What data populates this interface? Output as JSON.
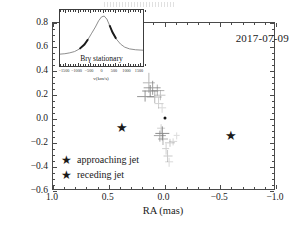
{
  "figure": {
    "date_label": "2017-07-09"
  },
  "axes": {
    "xlabel": "RA (mas)",
    "ylabel": "DEC (mas)",
    "xticks": [
      "1.0",
      "0.5",
      "0.0",
      "-0.5",
      "-1.0"
    ],
    "xtick_values": [
      1.0,
      0.5,
      0.0,
      -0.5,
      -1.0
    ],
    "yticks": [
      "0.8",
      "0.6",
      "0.4",
      "0.2",
      "0.0",
      "-0.2",
      "-0.4",
      "-0.6"
    ],
    "ytick_values": [
      0.8,
      0.6,
      0.4,
      0.2,
      0.0,
      -0.2,
      -0.4,
      -0.6
    ],
    "xlim": [
      1.0,
      -1.0
    ],
    "ylim": [
      -0.6,
      0.8
    ]
  },
  "legend": {
    "items": [
      {
        "marker": "star",
        "label": "approaching jet"
      },
      {
        "marker": "star",
        "label": "receding jet"
      }
    ]
  },
  "inset": {
    "label": "Brγ stationary",
    "xlabel": "v(km/s)",
    "xticks": [
      "-1500",
      "-1000",
      "-500",
      "0",
      "500",
      "1000",
      "1500"
    ],
    "xtick_values": [
      -1500,
      -1000,
      -500,
      0,
      500,
      1000,
      1500
    ]
  },
  "chart_data": {
    "type": "scatter",
    "title": "",
    "xlabel": "RA (mas)",
    "ylabel": "DEC (mas)",
    "xlim": [
      1.0,
      -1.0
    ],
    "ylim": [
      -0.6,
      0.8
    ],
    "grid": false,
    "legend_position": "lower-left",
    "annotations": [
      {
        "text": "2017-07-09",
        "x": -0.62,
        "y": 0.63
      }
    ],
    "series": [
      {
        "name": "approaching jet",
        "marker": "star",
        "color": "#1a1a1a",
        "points": [
          {
            "x": 0.38,
            "y": -0.07
          }
        ]
      },
      {
        "name": "receding jet",
        "marker": "star",
        "color": "#1a1a1a",
        "points": [
          {
            "x": -0.6,
            "y": -0.13
          }
        ]
      },
      {
        "name": "continuum centroid",
        "marker": "dot",
        "color": "#111111",
        "points": [
          {
            "x": 0.0,
            "y": 0.01
          }
        ]
      },
      {
        "name": "photocentre offsets",
        "marker": "cross-errorbar",
        "color": "#7d7d7d",
        "points": [
          {
            "x": 0.14,
            "y": 0.3,
            "xerr": 0.055,
            "yerr": 0.085,
            "alpha": 0.55
          },
          {
            "x": 0.11,
            "y": 0.26,
            "xerr": 0.075,
            "yerr": 0.06,
            "alpha": 0.75
          },
          {
            "x": 0.13,
            "y": 0.23,
            "xerr": 0.07,
            "yerr": 0.05,
            "alpha": 0.85
          },
          {
            "x": 0.06,
            "y": 0.24,
            "xerr": 0.06,
            "yerr": 0.045,
            "alpha": 0.6
          },
          {
            "x": 0.17,
            "y": 0.19,
            "xerr": 0.08,
            "yerr": 0.045,
            "alpha": 0.8
          },
          {
            "x": 0.09,
            "y": 0.18,
            "xerr": 0.065,
            "yerr": 0.05,
            "alpha": 0.55
          },
          {
            "x": 0.04,
            "y": 0.2,
            "xerr": 0.05,
            "yerr": 0.04,
            "alpha": 0.45
          },
          {
            "x": 0.05,
            "y": 0.13,
            "xerr": 0.04,
            "yerr": 0.045,
            "alpha": 0.35
          },
          {
            "x": 0.02,
            "y": 0.09,
            "xerr": 0.035,
            "yerr": 0.035,
            "alpha": 0.28
          },
          {
            "x": 0.03,
            "y": -0.08,
            "xerr": 0.035,
            "yerr": 0.04,
            "alpha": 0.35
          },
          {
            "x": 0.02,
            "y": -0.12,
            "xerr": 0.06,
            "yerr": 0.055,
            "alpha": 0.85
          },
          {
            "x": 0.04,
            "y": -0.14,
            "xerr": 0.055,
            "yerr": 0.045,
            "alpha": 0.7
          },
          {
            "x": 0.01,
            "y": -0.17,
            "xerr": 0.045,
            "yerr": 0.05,
            "alpha": 0.6
          },
          {
            "x": -0.05,
            "y": -0.2,
            "xerr": 0.045,
            "yerr": 0.035,
            "alpha": 0.4
          },
          {
            "x": -0.08,
            "y": -0.19,
            "xerr": 0.035,
            "yerr": 0.03,
            "alpha": 0.3
          },
          {
            "x": -0.01,
            "y": -0.25,
            "xerr": 0.035,
            "yerr": 0.045,
            "alpha": 0.35
          },
          {
            "x": -0.03,
            "y": -0.31,
            "xerr": 0.04,
            "yerr": 0.05,
            "alpha": 0.4
          },
          {
            "x": -0.04,
            "y": -0.36,
            "xerr": 0.035,
            "yerr": 0.035,
            "alpha": 0.28
          },
          {
            "x": -0.11,
            "y": -0.14,
            "xerr": 0.03,
            "yerr": 0.03,
            "alpha": 0.25
          }
        ]
      }
    ],
    "inset": {
      "type": "line",
      "title": "Brγ stationary",
      "xlabel": "v(km/s)",
      "ylabel": "",
      "xlim": [
        -1700,
        1700
      ],
      "x": [
        -1700,
        -1500,
        -1300,
        -1100,
        -900,
        -700,
        -550,
        -400,
        -250,
        -120,
        0,
        110,
        220,
        330,
        450,
        600,
        780,
        950,
        1150,
        1400,
        1700
      ],
      "y": [
        0.1,
        0.11,
        0.13,
        0.16,
        0.22,
        0.32,
        0.44,
        0.58,
        0.72,
        0.86,
        0.95,
        0.97,
        0.9,
        0.76,
        0.6,
        0.45,
        0.33,
        0.26,
        0.22,
        0.2,
        0.19
      ],
      "highlighted_segments": [
        {
          "name": "blue-wing",
          "x_range": [
            -900,
            -420
          ]
        },
        {
          "name": "red-wing",
          "x_range": [
            300,
            640
          ]
        }
      ]
    }
  }
}
